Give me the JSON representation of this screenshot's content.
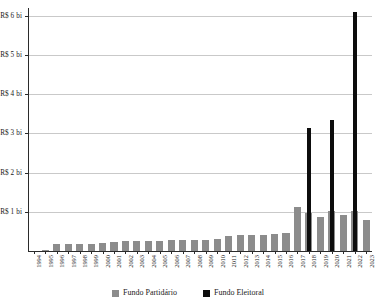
{
  "chart_data": {
    "type": "bar",
    "title": "",
    "subtitle": "",
    "xlabel": "",
    "ylabel": "",
    "grid": true,
    "legend_position": "bottom",
    "ylim": [
      0,
      6.2
    ],
    "ytick_values": [
      1,
      2,
      3,
      4,
      5,
      6
    ],
    "ytick_labels": [
      "R$ 1 bi",
      "R$ 2 bi",
      "R$ 3 bi",
      "R$ 4 bi",
      "R$ 5 bi",
      "R$ 6 bi"
    ],
    "categories": [
      "1994",
      "1995",
      "1996",
      "1997",
      "1998",
      "1999",
      "2000",
      "2001",
      "2002",
      "2003",
      "2004",
      "2005",
      "2006",
      "2007",
      "2008",
      "2009",
      "2010",
      "2011",
      "2012",
      "2013",
      "2014",
      "2015",
      "2016",
      "2017",
      "2018",
      "2019",
      "2020",
      "2021",
      "2022",
      "2023"
    ],
    "series": [
      {
        "name": "Fundo Partidário",
        "color": "#8c8c8c",
        "values": [
          0.01,
          0.02,
          0.17,
          0.17,
          0.18,
          0.18,
          0.21,
          0.24,
          0.25,
          0.25,
          0.25,
          0.26,
          0.27,
          0.28,
          0.29,
          0.29,
          0.31,
          0.38,
          0.4,
          0.4,
          0.41,
          0.43,
          0.47,
          1.12,
          0.96,
          0.88,
          1.01,
          0.93,
          1.03,
          0.8
        ]
      },
      {
        "name": "Fundo Eleitoral",
        "color": "#0d0d0d",
        "values": [
          0,
          0,
          0,
          0,
          0,
          0,
          0,
          0,
          0,
          0,
          0,
          0,
          0,
          0,
          0,
          0,
          0,
          0,
          0,
          0,
          0,
          0,
          0,
          0,
          3.15,
          0,
          3.35,
          0,
          6.1,
          0
        ]
      }
    ]
  },
  "legend": {
    "items": [
      {
        "label": "Fundo Partidário",
        "swatch": "partidario"
      },
      {
        "label": "Fundo Eleitoral",
        "swatch": "eleitoral"
      }
    ]
  }
}
